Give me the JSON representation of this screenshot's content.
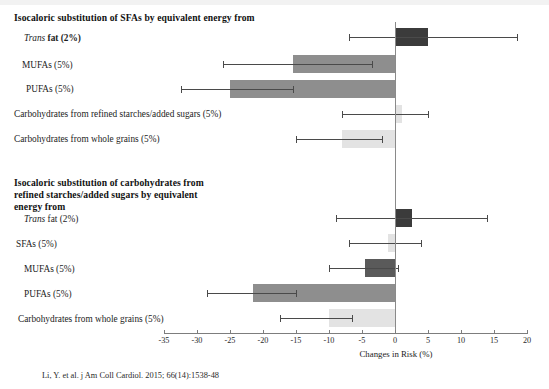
{
  "figure": {
    "citation": "Li, Y. et al. j Am Coll Cardiol. 2015; 66(14):1538-48",
    "axis_title": "Changes in Risk (%)"
  },
  "sections": [
    {
      "title": "Isocaloric substitution of SFAs by equivalent energy from"
    },
    {
      "title": "Isocaloric substitution of carbohydrates from refined starches/added sugars by equivalent energy from"
    }
  ],
  "labels": {
    "s1r1": "Trans fat (2%)",
    "s1r1_italic": "Trans",
    "s1r1_bold": "fat (2%)",
    "s1r2": "MUFAs (5%)",
    "s1r3": "PUFAs (5%)",
    "s1r4": "Carbohydrates from refined starches/added sugars (5%)",
    "s1r5": "Carbohydrates from whole grains (5%)",
    "s2r1_italic": "Trans",
    "s2r1_rest": "fat (2%)",
    "s2r2": "SFAs (5%)",
    "s2r3": "MUFAs (5%)",
    "s2r4": "PUFAs (5%)",
    "s2r5": "Carbohydrates from whole grains (5%)"
  },
  "chart_data": {
    "type": "bar",
    "orientation": "horizontal",
    "xlabel": "Changes in Risk (%)",
    "ylabel": "",
    "xlim": [
      -35,
      20
    ],
    "xticks": [
      -35,
      -30,
      -25,
      -20,
      -15,
      -10,
      -5,
      0,
      5,
      10,
      15,
      20
    ],
    "xticklabels": [
      "-35",
      "-30",
      "-25",
      "-20",
      "-15",
      "-10",
      "-5",
      "0",
      "5",
      "10",
      "15",
      "20"
    ],
    "grid": false,
    "legend": false,
    "reference_line": 0,
    "panels": [
      {
        "name": "Isocaloric substitution of SFAs by equivalent energy from",
        "bars": [
          {
            "category": "Trans fat (2%)",
            "value": 5.0,
            "ci_low": -7.0,
            "ci_high": 18.5,
            "color": "#3b3b3b"
          },
          {
            "category": "MUFAs (5%)",
            "value": -15.5,
            "ci_low": -26.0,
            "ci_high": -3.5,
            "color": "#8e8e8e"
          },
          {
            "category": "PUFAs (5%)",
            "value": -25.0,
            "ci_low": -32.5,
            "ci_high": -15.5,
            "color": "#8e8e8e"
          },
          {
            "category": "Carbohydrates from refined starches/added sugars (5%)",
            "value": 1.0,
            "ci_low": -8.0,
            "ci_high": 5.0,
            "color": "#e3e3e3"
          },
          {
            "category": "Carbohydrates from whole grains (5%)",
            "value": -8.0,
            "ci_low": -15.0,
            "ci_high": -2.0,
            "color": "#e3e3e3"
          }
        ]
      },
      {
        "name": "Isocaloric substitution of carbohydrates from refined starches/added sugars by equivalent energy from",
        "bars": [
          {
            "category": "Trans fat (2%)",
            "value": 2.5,
            "ci_low": -9.0,
            "ci_high": 14.0,
            "color": "#3b3b3b"
          },
          {
            "category": "SFAs (5%)",
            "value": -1.0,
            "ci_low": -7.0,
            "ci_high": 4.0,
            "color": "#e3e3e3"
          },
          {
            "category": "MUFAs (5%)",
            "value": -4.5,
            "ci_low": -10.0,
            "ci_high": 0.5,
            "color": "#5a5a5a"
          },
          {
            "category": "PUFAs (5%)",
            "value": -21.5,
            "ci_low": -28.5,
            "ci_high": -15.0,
            "color": "#8e8e8e"
          },
          {
            "category": "Carbohydrates from whole grains (5%)",
            "value": -10.0,
            "ci_low": -17.5,
            "ci_high": -6.5,
            "color": "#e3e3e3"
          }
        ]
      }
    ]
  }
}
